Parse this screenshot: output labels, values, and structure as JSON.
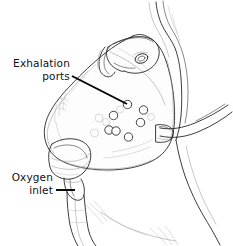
{
  "figure": {
    "background_color": "#ffffff",
    "ink_color": "#1a1a1a",
    "width": 233,
    "height": 246
  },
  "callouts": [
    {
      "id": "exhalation-ports",
      "line1": "Exhalation",
      "line2": "ports",
      "text_x": 70,
      "text_y1": 67,
      "text_y2": 80,
      "leader_from_x": 72,
      "leader_from_y": 76,
      "leader_to_x": 127,
      "leader_to_y": 104
    },
    {
      "id": "oxygen-inlet",
      "line1": "Oxygen",
      "line2": "inlet",
      "text_x": 53,
      "text_y1": 181,
      "text_y2": 194,
      "leader_from_x": 56,
      "leader_from_y": 190,
      "leader_to_x": 75,
      "leader_to_y": 190
    }
  ],
  "parts": {
    "mask_body": "oxygen face mask shell",
    "head_strap": "elastic head strap",
    "strap_buckle": "strap adjustment buckle",
    "exhalation_ports": "cluster of exhalation port holes",
    "oxygen_inlet": "oxygen inlet connector",
    "oxygen_tubing": "oxygen supply tubing",
    "patient_face": "patient face in profile"
  },
  "exhalation_ports": {
    "count": 7,
    "radius": 4.2,
    "positions": [
      {
        "cx": 127.5,
        "cy": 104.5
      },
      {
        "cx": 143.5,
        "cy": 110.0
      },
      {
        "cx": 113.5,
        "cy": 115.5
      },
      {
        "cx": 140.5,
        "cy": 122.5
      },
      {
        "cx": 109.0,
        "cy": 130.0
      },
      {
        "cx": 116.0,
        "cy": 131.0
      },
      {
        "cx": 128.5,
        "cy": 137.0
      }
    ],
    "ghost_positions": [
      {
        "cx": 99.0,
        "cy": 118.0
      },
      {
        "cx": 94.5,
        "cy": 133.0
      },
      {
        "cx": 106.0,
        "cy": 122.0
      },
      {
        "cx": 120.0,
        "cy": 109.5
      },
      {
        "cx": 151.0,
        "cy": 117.0
      }
    ]
  }
}
